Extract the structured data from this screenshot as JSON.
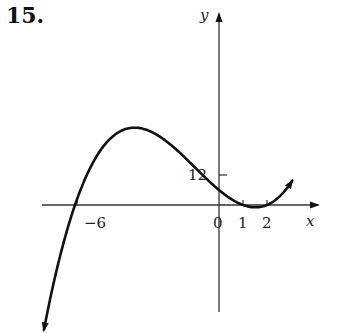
{
  "problem": {
    "number": "15."
  },
  "chart_data": {
    "type": "line",
    "title": "",
    "xlabel": "x",
    "ylabel": "y",
    "function": "y = (x + 6)(x - 1)(x - 2)",
    "x_ticks": [
      {
        "value": -6,
        "label": "-6"
      },
      {
        "value": 0,
        "label": "0"
      },
      {
        "value": 1,
        "label": "1"
      },
      {
        "value": 2,
        "label": "2"
      }
    ],
    "y_ticks": [
      {
        "value": 12,
        "label": "12"
      }
    ],
    "x_intercepts": [
      -6,
      1,
      2
    ],
    "y_intercept": 12,
    "xlim": [
      -7.2,
      4.2
    ],
    "grid": false,
    "legend": null,
    "arrows": {
      "left_end": "down",
      "right_end": "up"
    }
  },
  "labels": {
    "y_axis": "y",
    "x_axis": "x",
    "tick_neg6": "−6",
    "tick_0": "0",
    "tick_1": "1",
    "tick_2": "2",
    "tick_12": "12"
  },
  "colors": {
    "ink": "#111111",
    "background": "#ffffff"
  }
}
